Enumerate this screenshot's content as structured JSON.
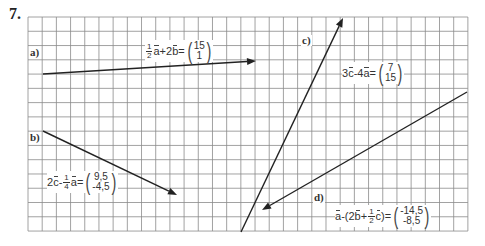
{
  "task": {
    "number": "7."
  },
  "grid": {
    "left": 28,
    "top": 17,
    "cols": 31,
    "rows": 15,
    "cell_w": 14.19,
    "cell_h": 14.27,
    "line_color": "#8a8a8a",
    "border_color": "#777777"
  },
  "vectors": [
    {
      "id": "a",
      "label": "a)",
      "x1": 43,
      "y1": 74,
      "x2": 256,
      "y2": 61,
      "expr_parts": [
        "1",
        "2",
        "a",
        "+2",
        "b",
        "="
      ],
      "result": [
        "15",
        "1"
      ]
    },
    {
      "id": "b",
      "label": "b)",
      "x1": 43,
      "y1": 131,
      "x2": 177,
      "y2": 195,
      "expr_parts": [
        "2",
        "c",
        " -",
        "1",
        "4",
        "a",
        "="
      ],
      "result": [
        "9,5",
        "-4,5"
      ]
    },
    {
      "id": "c",
      "label": "c)",
      "x1": 241,
      "y1": 232,
      "x2": 343,
      "y2": 18,
      "expr_parts": [
        "3",
        "c",
        "-4",
        "a",
        "="
      ],
      "result": [
        "7",
        "15"
      ]
    },
    {
      "id": "d",
      "label": "d)",
      "x1": 467,
      "y1": 92,
      "x2": 262,
      "y2": 210,
      "expr_parts": [
        "a",
        "-(2",
        "b",
        "+",
        "1",
        "2",
        "c",
        ")="
      ],
      "result": [
        "-14,5",
        "-8,5"
      ]
    }
  ],
  "line_color": "#222222"
}
